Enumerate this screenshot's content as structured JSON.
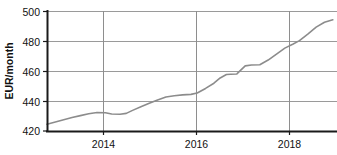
{
  "chart_data": {
    "type": "line",
    "title": "",
    "subtitle": "",
    "xlabel": "",
    "ylabel": "EUR/month",
    "xlim": [
      2012.0,
      2018.95
    ],
    "ylim": [
      420,
      500
    ],
    "ytick_labels": [
      "500",
      "480",
      "460",
      "440",
      "420"
    ],
    "ytick_values": [
      500,
      480,
      460,
      440,
      420
    ],
    "xtick_labels": [
      "2014",
      "2016",
      "2018"
    ],
    "xtick_values": [
      2014,
      2016,
      2018
    ],
    "grid": "horizontal",
    "legend": "none",
    "series": [
      {
        "name": "EUR/month",
        "color": "#8c8c8c",
        "x": [
          2012.0,
          2012.2,
          2012.4,
          2012.6,
          2012.8,
          2013.0,
          2013.2,
          2013.4,
          2013.55,
          2013.75,
          2013.9,
          2014.05,
          2014.25,
          2014.45,
          2014.65,
          2014.85,
          2015.05,
          2015.25,
          2015.45,
          2015.6,
          2015.8,
          2016.0,
          2016.15,
          2016.3,
          2016.4,
          2016.55,
          2016.75,
          2016.9,
          2017.1,
          2017.3,
          2017.5,
          2017.7,
          2017.9,
          2018.05,
          2018.25,
          2018.45,
          2018.65,
          2018.85
        ],
        "y": [
          424.5,
          426.0,
          427.5,
          429.0,
          430.3,
          431.6,
          432.4,
          432.2,
          431.4,
          431.2,
          431.8,
          433.8,
          436.2,
          438.6,
          440.8,
          442.8,
          443.6,
          444.2,
          444.5,
          445.4,
          448.5,
          452.0,
          455.5,
          457.8,
          458.0,
          458.2,
          463.6,
          464.2,
          464.4,
          467.5,
          471.5,
          475.5,
          478.2,
          480.5,
          484.8,
          489.5,
          492.8,
          494.5
        ]
      }
    ]
  },
  "axes": {
    "ylabel": "EUR/month",
    "ytick_labels": [
      "500",
      "480",
      "460",
      "440",
      "420"
    ],
    "xtick_labels": [
      "2014",
      "2016",
      "2018"
    ]
  },
  "colors": {
    "line": "#8c8c8c",
    "gridline": "#9a9a9a",
    "axis": "#1a1a1a",
    "background": "#ffffff"
  }
}
